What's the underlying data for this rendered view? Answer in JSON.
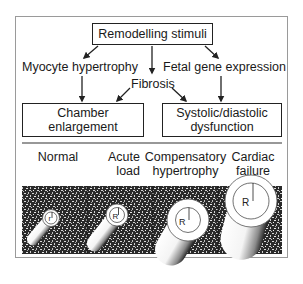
{
  "diagram": {
    "title_box": "Remodelling stimuli",
    "branches": {
      "left": "Myocyte hypertrophy",
      "center": "Fibrosis",
      "right": "Fetal gene expression"
    },
    "outcomes": {
      "left_line1": "Chamber",
      "left_line2": "enlargement",
      "right_line1": "Systolic/diastolic",
      "right_line2": "dysfunction"
    },
    "stages": [
      {
        "line1": "Normal",
        "line2": "",
        "radius_label": "r"
      },
      {
        "line1": "Acute",
        "line2": "load",
        "radius_label": "R"
      },
      {
        "line1": "Compensatory",
        "line2": "hypertrophy",
        "radius_label": "R"
      },
      {
        "line1": "Cardiac",
        "line2": "failure",
        "radius_label": "R"
      }
    ],
    "colors": {
      "line": "#222222",
      "frame": "#9a9a9a",
      "tissue_dark": "#2a2a2a",
      "tissue_speckle": "#d8d8d8"
    }
  }
}
